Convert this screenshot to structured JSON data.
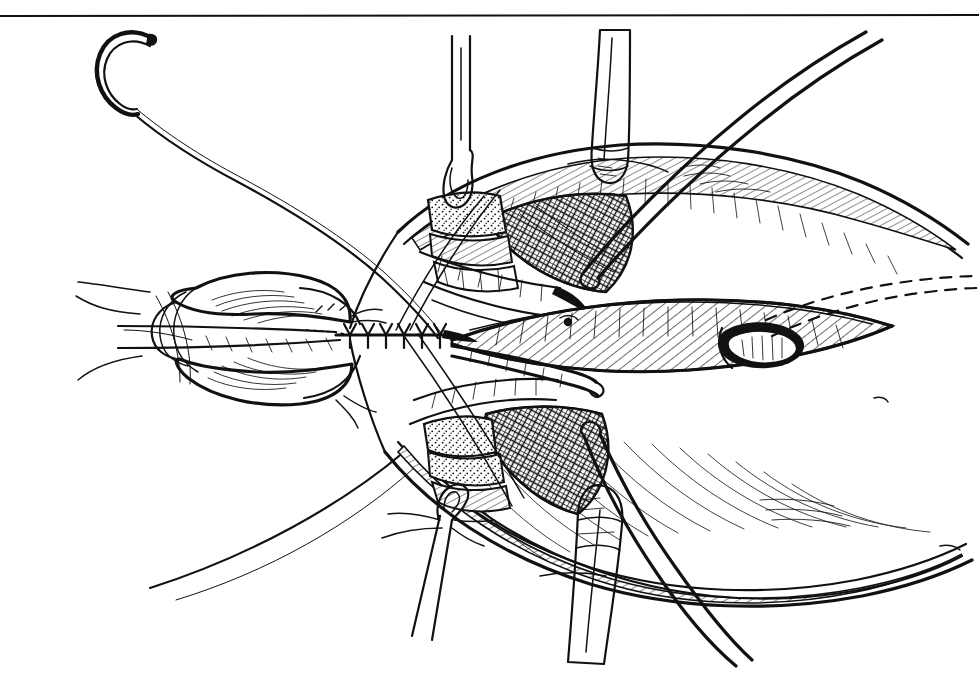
{
  "figure": {
    "kind": "line-art-illustration",
    "title": "Completed end-to-end anastomosis within opened neck wound",
    "medium": "pen-and-ink line drawing",
    "background_color": "#ffffff",
    "ink_color": "#111111",
    "width_px": 979,
    "height_px": 691,
    "border": {
      "name": "top-rule",
      "present_edges": [
        "top"
      ],
      "y_px": 16,
      "x_start_px": 0,
      "x_end_px": 979,
      "thickness_px": 2,
      "color": "#3a3a3a"
    }
  },
  "elements": {
    "needle": {
      "label": "curved surgical needle",
      "location": "upper-left",
      "center_px": [
        130,
        60
      ],
      "shape": "half-circle taper point, open to the right"
    },
    "suture_tail": {
      "label": "long suture strand from needle",
      "path": "sweeps down-right from needle to the wound field",
      "from_px": [
        140,
        100
      ],
      "to_px": [
        400,
        330
      ]
    },
    "retractor_hook_upper": {
      "label": "skin hook retractor, upper",
      "location": "top-center-left",
      "stem_top_px": [
        460,
        40
      ],
      "hook_px": [
        458,
        185
      ]
    },
    "retractor_hook_lower": {
      "label": "skin hook retractor, lower",
      "location": "bottom-center-left",
      "stem_bottom_px": [
        410,
        600
      ],
      "hook_px": [
        452,
        505
      ]
    },
    "retractor_blade_upper": {
      "label": "tapered retractor blade, upper",
      "location": "top-center",
      "tip_px": [
        608,
        175
      ],
      "stem_top_px": [
        620,
        30
      ]
    },
    "retractor_blade_lower": {
      "label": "tapered retractor blade, lower",
      "location": "bottom-center",
      "tip_px": [
        585,
        440
      ],
      "stem_bottom_px": [
        578,
        660
      ]
    },
    "instrument_probe_upper_right": {
      "label": "curved probe / traction tape, upper right",
      "from_px": [
        585,
        270
      ],
      "to_px": [
        800,
        40
      ]
    },
    "instrument_probe_lower_right": {
      "label": "curved probe / traction tape, lower right",
      "from_px": [
        600,
        440
      ],
      "to_px": [
        700,
        665
      ]
    },
    "probe_in_lumen": {
      "label": "blunt probe lying inside opened lumen",
      "from_px": [
        470,
        340
      ],
      "to_px": [
        600,
        360
      ]
    },
    "anastomosis_suture_line": {
      "label": "completed interrupted suture line",
      "y_px": 335,
      "x_start_px": 340,
      "x_end_px": 440,
      "stitch_count": 6,
      "stitch_shape": "Y"
    },
    "dashed_outline": {
      "label": "dashed contour indicating deep / hidden margin",
      "location": "far right",
      "from_px": [
        770,
        300
      ],
      "to_px": [
        979,
        270
      ]
    },
    "tissue_planes": [
      {
        "name": "stippled-fat-pad-upper",
        "pattern": "stipple",
        "region_px": [
          425,
          195,
          90,
          75
        ]
      },
      {
        "name": "crosshatch-muscle-upper",
        "pattern": "cross-hatch",
        "region_px": [
          500,
          185,
          130,
          105
        ]
      },
      {
        "name": "stippled-fat-pad-lower",
        "pattern": "stipple",
        "region_px": [
          420,
          420,
          90,
          75
        ]
      },
      {
        "name": "crosshatch-muscle-lower",
        "pattern": "cross-hatch",
        "region_px": [
          490,
          410,
          130,
          100
        ]
      },
      {
        "name": "hatched-skin-flap-upper",
        "pattern": "parallel-hatch",
        "region_px": [
          480,
          140,
          420,
          70
        ]
      },
      {
        "name": "hatched-skin-flap-lower",
        "pattern": "parallel-hatch",
        "region_px": [
          470,
          480,
          430,
          110
        ]
      },
      {
        "name": "hatched-trachea-right",
        "pattern": "parallel-hatch",
        "region_px": [
          500,
          300,
          380,
          70
        ]
      }
    ],
    "organ_left": {
      "label": "mobilized organ / proximal stump with serosal striations",
      "region_px": [
        140,
        265,
        250,
        145
      ]
    },
    "stoma_right": {
      "label": "small open orifice in right tissue flap",
      "center_px": [
        760,
        345
      ]
    }
  },
  "legend": {
    "visible": false,
    "items": []
  }
}
